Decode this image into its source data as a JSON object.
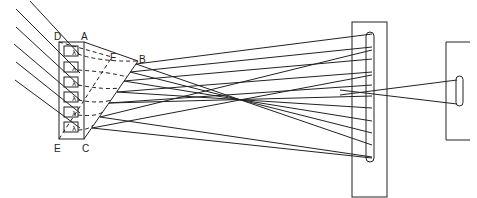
{
  "diagram": {
    "title": "",
    "labels": {
      "D": "D",
      "A": "A",
      "F": "F",
      "B": "B",
      "E": "E",
      "C": "C"
    },
    "grating_cells": [
      {
        "symbol": "λ"
      },
      {
        "symbol": "λ"
      },
      {
        "symbol": "λ"
      },
      {
        "symbol": "λ"
      },
      {
        "symbol": "λ"
      },
      {
        "symbol": "λ"
      }
    ],
    "components": [
      {
        "name": "incident-rays",
        "count": 6
      },
      {
        "name": "grating-box",
        "corners": [
          "D",
          "A",
          "C",
          "E"
        ]
      },
      {
        "name": "prism-wedge",
        "corners": [
          "A",
          "B",
          "C"
        ]
      },
      {
        "name": "cylinder-lens-plate"
      },
      {
        "name": "small-cylinder-lens-screen"
      }
    ],
    "stroke_color": "#222222",
    "background": "#ffffff"
  }
}
